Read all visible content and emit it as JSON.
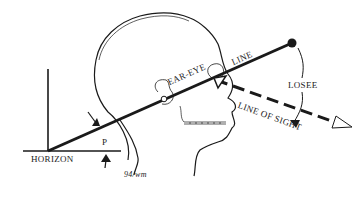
{
  "diagram": {
    "labels": {
      "ear_eye": "EAR-EYE",
      "line": "LINE",
      "losee": "LOSEE",
      "line_of_sight": "LINE OF SIGHT",
      "horizon": "HORIZON",
      "p": "P",
      "signature": "94/wm"
    },
    "colors": {
      "ink": "#1a1a1a",
      "background": "#ffffff"
    }
  }
}
